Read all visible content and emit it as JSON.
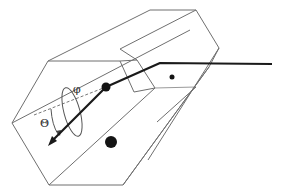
{
  "figure": {
    "type": "3d-scattering-geometry-diagram",
    "labels": {
      "phi": "φ",
      "theta": "Θ"
    },
    "elements": [
      "hexagonal-prism-outline",
      "incident-ray",
      "refracted-ray-with-arrow",
      "azimuth-ellipse",
      "scattering-point",
      "small-dot",
      "large-dot"
    ],
    "colors": {
      "background": "#ffffff",
      "edges": "#6f6f6f",
      "ray": "#1a1a1a",
      "dots": "#141414"
    }
  }
}
